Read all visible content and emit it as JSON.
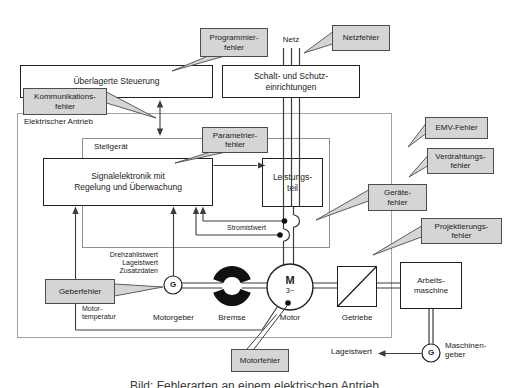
{
  "boxes": {
    "ueberlagerte_steuerung": "Überlagerte Steuerung",
    "schaltgeraete": "Schalt- und Schutz-\neinrichtungen",
    "elektrischer_antrieb": "Elektrischer Antrieb",
    "stellgeraet": "Stellgerät",
    "signalelektronik": "Signalelektronik mit\nRegelung und Überwachung",
    "leistungsteil": "Leistungs-\nteil",
    "arbeitsmaschine": "Arbeits-\nmaschine"
  },
  "faults": {
    "programmierfehler": "Programmier-\nfehler",
    "netzfehler": "Netzfehler",
    "kommunikationsfehler": "Kommunikations-\nfehler",
    "parametrierfehler": "Parametrier-\nfehler",
    "emv_fehler": "EMV-Fehler",
    "verdrahtungsfehler": "Verdrahtungs-\nfehler",
    "geraetefehler": "Geräte-\nfehler",
    "projektierungsfehler": "Projektierungs-\nfehler",
    "geberfehler": "Geberfehler",
    "motorfehler": "Motorfehler"
  },
  "labels": {
    "netz": "Netz",
    "stromistwert": "Stromistwert",
    "geber_signale": "Drehzahlistwert\nLageistwert\nZusatzdaten",
    "motortemperatur": "Motor-\ntemperatur",
    "motorgeber": "Motorgeber",
    "bremse": "Bremse",
    "motor": "Motor",
    "motor_m": "M",
    "motor_3ph": "3~",
    "getriebe": "Getriebe",
    "lageistwert": "Lageistwert",
    "maschinengeber": "Maschinen-\ngeber",
    "geber_g": "G"
  },
  "colors": {
    "callout_fill": "#d5d5d5",
    "callout_border": "#4d4d4d",
    "box_border": "#1f1f1f",
    "system_frame_gray": "#a3a3a3",
    "line": "#3c3c3c"
  },
  "caption": "Bild: Fehlerarten an einem elektrischen Antrieb"
}
